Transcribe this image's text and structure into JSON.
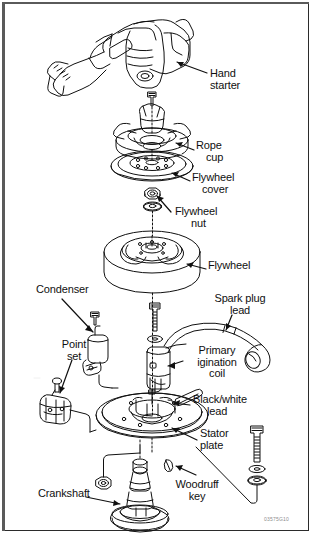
{
  "figure": {
    "kind": "exploded-parts-diagram",
    "code": "03575G10",
    "background_color": "#ffffff",
    "line_color": "#101010",
    "frame_color": "#2b2b2b"
  },
  "labels": [
    {
      "id": "hand-starter",
      "text": "Hand\nstarter",
      "lines": [
        "Hand",
        "starter"
      ],
      "x": 210,
      "y": 68,
      "align": "left"
    },
    {
      "id": "rope-cup",
      "text": "Rope\ncup",
      "lines": [
        "Rope",
        "cup"
      ],
      "x": 196,
      "y": 146,
      "align": "left"
    },
    {
      "id": "flywheel-cover",
      "text": "Flywheel\ncover",
      "lines": [
        "Flywheel",
        "cover"
      ],
      "x": 192,
      "y": 176,
      "align": "left"
    },
    {
      "id": "flywheel-nut",
      "text": "Flywheel\nnut",
      "lines": [
        "Flywheel",
        "nut"
      ],
      "x": 175,
      "y": 210,
      "align": "left"
    },
    {
      "id": "flywheel",
      "text": "Flywheel",
      "lines": [
        "Flywheel"
      ],
      "x": 208,
      "y": 264,
      "align": "left"
    },
    {
      "id": "condenser",
      "text": "Condenser",
      "lines": [
        "Condenser"
      ],
      "x": 36,
      "y": 288,
      "align": "left"
    },
    {
      "id": "spark-plug-lead",
      "text": "Spark plug\nlead",
      "lines": [
        "Spark plug",
        "lead"
      ],
      "x": 236,
      "y": 299,
      "align": "center"
    },
    {
      "id": "point-set",
      "text": "Point\nset",
      "lines": [
        "Point",
        "set"
      ],
      "x": 74,
      "y": 343,
      "align": "center"
    },
    {
      "id": "primary-coil",
      "text": "Primary\nigination\ncoil",
      "lines": [
        "Primary",
        "igination",
        "coil"
      ],
      "x": 186,
      "y": 351,
      "align": "left"
    },
    {
      "id": "black-white-lead",
      "text": "Black/white\nlead",
      "lines": [
        "Black/white",
        "lead"
      ],
      "x": 193,
      "y": 398,
      "align": "left"
    },
    {
      "id": "stator-plate",
      "text": "Stator\nplate",
      "lines": [
        "Stator",
        "plate"
      ],
      "x": 200,
      "y": 432,
      "align": "left"
    },
    {
      "id": "woodruff-key",
      "text": "Woodruff\nkey",
      "lines": [
        "Woodruff",
        "key"
      ],
      "x": 197,
      "y": 483,
      "align": "center"
    },
    {
      "id": "crankshaft",
      "text": "Crankshaft",
      "lines": [
        "Crankshaft"
      ],
      "x": 38,
      "y": 492,
      "align": "left"
    }
  ],
  "parts": [
    {
      "id": "hand-starter-housing",
      "label": "Hand starter"
    },
    {
      "id": "rope-cup-body",
      "label": "Rope cup"
    },
    {
      "id": "rope-cup-screw",
      "label": "Rope cup screw"
    },
    {
      "id": "flywheel-cover-disc",
      "label": "Flywheel cover"
    },
    {
      "id": "flywheel-nut-hex",
      "label": "Flywheel nut"
    },
    {
      "id": "flywheel-washer",
      "label": "Flywheel washer"
    },
    {
      "id": "flywheel-body",
      "label": "Flywheel"
    },
    {
      "id": "condenser-body",
      "label": "Condenser"
    },
    {
      "id": "condenser-screw",
      "label": "Condenser screw"
    },
    {
      "id": "point-set-body",
      "label": "Point set"
    },
    {
      "id": "point-set-screw",
      "label": "Point set screw"
    },
    {
      "id": "primary-coil-body",
      "label": "Primary ignition coil"
    },
    {
      "id": "coil-screw",
      "label": "Coil screw"
    },
    {
      "id": "spark-plug-cable",
      "label": "Spark plug lead"
    },
    {
      "id": "spark-plug-boot",
      "label": "Spark plug boot"
    },
    {
      "id": "black-white-wire",
      "label": "Black/white lead"
    },
    {
      "id": "stator-plate-disc",
      "label": "Stator plate"
    },
    {
      "id": "woodruff-key-body",
      "label": "Woodruff key"
    },
    {
      "id": "crankshaft-body",
      "label": "Crankshaft"
    },
    {
      "id": "stator-bolt",
      "label": "Stator mounting bolt"
    },
    {
      "id": "stator-washers",
      "label": "Stator washers"
    },
    {
      "id": "lower-nut",
      "label": "Lower nut"
    }
  ]
}
